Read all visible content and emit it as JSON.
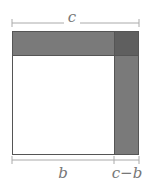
{
  "diagram": {
    "labels": {
      "top": "c",
      "bottom_left": "b",
      "bottom_right": "c−b"
    },
    "colors": {
      "band": "#7a7a7a",
      "corner": "#5f5f5f",
      "inner": "#ffffff",
      "outline": "#555555",
      "dimension_line": "#aaaaaa",
      "label": "#777777"
    }
  }
}
